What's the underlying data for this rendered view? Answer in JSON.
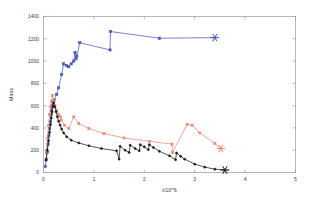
{
  "chart_data": {
    "type": "line",
    "title": "",
    "xlabel": "t/10^6",
    "ylabel": "Mass",
    "xlim": [
      0,
      5
    ],
    "ylim": [
      0,
      1400
    ],
    "xticks": [
      0,
      1,
      2,
      3,
      4,
      5
    ],
    "xticklabels": [
      "0",
      "1",
      "2",
      "3",
      "4",
      "5"
    ],
    "yticks": [
      0,
      200,
      400,
      600,
      800,
      1000,
      1200,
      1400
    ],
    "yticklabels": [
      "0",
      "200",
      "400",
      "600",
      "800",
      "1000",
      "1200",
      "1400"
    ],
    "grid": false,
    "legend": "none",
    "series": [
      {
        "name": "blue-series",
        "color": "#4a5bb5",
        "marker": "square",
        "marker_size": 2.2,
        "end_marker": "asterisk",
        "points": [
          [
            0.035,
            55
          ],
          [
            0.055,
            120
          ],
          [
            0.075,
            185
          ],
          [
            0.09,
            255
          ],
          [
            0.105,
            330
          ],
          [
            0.12,
            395
          ],
          [
            0.135,
            460
          ],
          [
            0.15,
            520
          ],
          [
            0.16,
            560
          ],
          [
            0.175,
            600
          ],
          [
            0.185,
            635
          ],
          [
            0.21,
            650
          ],
          [
            0.26,
            700
          ],
          [
            0.3,
            760
          ],
          [
            0.36,
            880
          ],
          [
            0.4,
            975
          ],
          [
            0.455,
            960
          ],
          [
            0.5,
            950
          ],
          [
            0.55,
            975
          ],
          [
            0.6,
            1000
          ],
          [
            0.625,
            1075
          ],
          [
            0.645,
            1020
          ],
          [
            0.66,
            1045
          ],
          [
            0.72,
            1165
          ],
          [
            1.32,
            1100
          ],
          [
            1.33,
            1265
          ],
          [
            2.3,
            1205
          ],
          [
            3.4,
            1210
          ]
        ]
      },
      {
        "name": "red-series",
        "color": "#f08878",
        "marker": "square",
        "marker_size": 2.0,
        "end_marker": "asterisk",
        "points": [
          [
            0.055,
            175
          ],
          [
            0.08,
            310
          ],
          [
            0.1,
            420
          ],
          [
            0.12,
            520
          ],
          [
            0.14,
            590
          ],
          [
            0.16,
            640
          ],
          [
            0.175,
            690
          ],
          [
            0.2,
            640
          ],
          [
            0.225,
            600
          ],
          [
            0.26,
            560
          ],
          [
            0.3,
            520
          ],
          [
            0.335,
            500
          ],
          [
            0.35,
            470
          ],
          [
            0.42,
            425
          ],
          [
            0.5,
            395
          ],
          [
            0.6,
            500
          ],
          [
            0.7,
            440
          ],
          [
            0.9,
            395
          ],
          [
            1.2,
            350
          ],
          [
            1.6,
            310
          ],
          [
            2.1,
            280
          ],
          [
            2.55,
            255
          ],
          [
            2.56,
            180
          ],
          [
            2.85,
            430
          ],
          [
            2.95,
            425
          ],
          [
            3.1,
            355
          ],
          [
            3.4,
            260
          ],
          [
            3.52,
            215
          ]
        ]
      },
      {
        "name": "black-series",
        "color": "#1a1a1a",
        "marker": "circle",
        "marker_size": 2.0,
        "end_marker": "asterisk",
        "points": [
          [
            0.05,
            110
          ],
          [
            0.075,
            200
          ],
          [
            0.1,
            285
          ],
          [
            0.12,
            360
          ],
          [
            0.14,
            430
          ],
          [
            0.155,
            490
          ],
          [
            0.17,
            545
          ],
          [
            0.185,
            590
          ],
          [
            0.2,
            625
          ],
          [
            0.225,
            590
          ],
          [
            0.25,
            545
          ],
          [
            0.275,
            500
          ],
          [
            0.3,
            460
          ],
          [
            0.33,
            425
          ],
          [
            0.36,
            390
          ],
          [
            0.4,
            355
          ],
          [
            0.46,
            320
          ],
          [
            0.55,
            290
          ],
          [
            0.7,
            265
          ],
          [
            0.9,
            240
          ],
          [
            1.15,
            215
          ],
          [
            1.45,
            195
          ],
          [
            1.5,
            120
          ],
          [
            1.52,
            235
          ],
          [
            1.62,
            200
          ],
          [
            1.7,
            180
          ],
          [
            1.72,
            245
          ],
          [
            1.82,
            215
          ],
          [
            1.9,
            195
          ],
          [
            1.92,
            250
          ],
          [
            2.0,
            230
          ],
          [
            2.08,
            205
          ],
          [
            2.1,
            250
          ],
          [
            2.18,
            225
          ],
          [
            2.3,
            190
          ],
          [
            2.5,
            150
          ],
          [
            2.62,
            115
          ],
          [
            2.64,
            175
          ],
          [
            2.72,
            145
          ],
          [
            2.8,
            120
          ],
          [
            3.0,
            75
          ],
          [
            3.2,
            48
          ],
          [
            3.4,
            30
          ],
          [
            3.6,
            22
          ]
        ]
      }
    ]
  }
}
